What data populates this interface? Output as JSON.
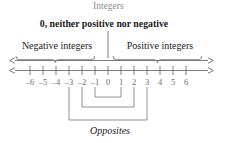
{
  "figure": {
    "title_label": "Integers",
    "zero_note": "0, neither positive nor negative",
    "negative_label": "Negative integers",
    "positive_label": "Positive integers",
    "opposites_label": "Opposites"
  },
  "colors": {
    "line": "#6e6e6e",
    "text_dark": "#1a1a1a",
    "text_gray": "#8c8c8c",
    "tick_label": "#6e6e6e",
    "bracket": "#8a8a8a",
    "background": "#ffffff"
  },
  "number_line": {
    "min": -6,
    "max": 6,
    "tick_labels": [
      "–6",
      "–5",
      "–4",
      "–3",
      "–2",
      "–1",
      "0",
      "1",
      "2",
      "3",
      "4",
      "5",
      "6"
    ],
    "tick_values": [
      -6,
      -5,
      -4,
      -3,
      -2,
      -1,
      0,
      1,
      2,
      3,
      4,
      5,
      6
    ]
  },
  "opposite_pairs": [
    {
      "left": -1,
      "right": 1
    },
    {
      "left": -2,
      "right": 2
    },
    {
      "left": -3,
      "right": 3
    }
  ]
}
